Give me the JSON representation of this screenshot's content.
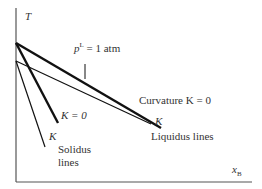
{
  "diagram": {
    "y_axis_label": "T",
    "x_axis_label": "x",
    "x_axis_label_sub": "B",
    "pressure_label_p": "p",
    "pressure_label_sup": "L",
    "pressure_label_rest": " = 1 atm",
    "curvature_label": "Curvature K = 0",
    "liquidus_k_label": "K",
    "solidus_k0_label": "K = 0",
    "solidus_k_label": "K",
    "liquidus_lines_label": "Liquidus lines",
    "solidus_lines_label_1": "Solidus",
    "solidus_lines_label_2": "lines"
  },
  "colors": {
    "line": "#111111",
    "axis": "#555555",
    "text": "#333333"
  }
}
